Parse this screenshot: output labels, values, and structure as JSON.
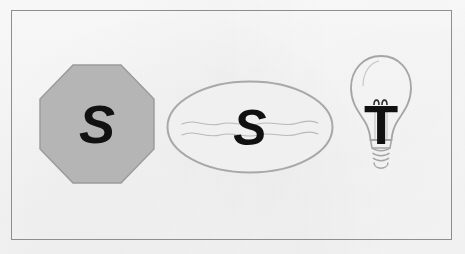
{
  "canvas": {
    "width": 465,
    "height": 254,
    "background_color": "#f7f7f7",
    "frame_color": "#8e8e8e"
  },
  "figures": [
    {
      "id": "octagon",
      "shape_name": "octagon",
      "label": "S",
      "fill_color": "#b5b5b5",
      "stroke_color": "#9a9a9a",
      "label_color": "#111111"
    },
    {
      "id": "ellipse",
      "shape_name": "ellipse",
      "label": "S",
      "fill_color": "#f0f0f0",
      "stroke_color": "#a8a8a8",
      "label_color": "#111111",
      "decoration": "wavy-lines",
      "decoration_color": "#b9b9b9"
    },
    {
      "id": "lightbulb",
      "shape_name": "light-bulb",
      "label": "T",
      "fill_color": "none",
      "stroke_color": "#a5a5a5",
      "label_color": "#111111",
      "detail": "filament-coil"
    }
  ]
}
